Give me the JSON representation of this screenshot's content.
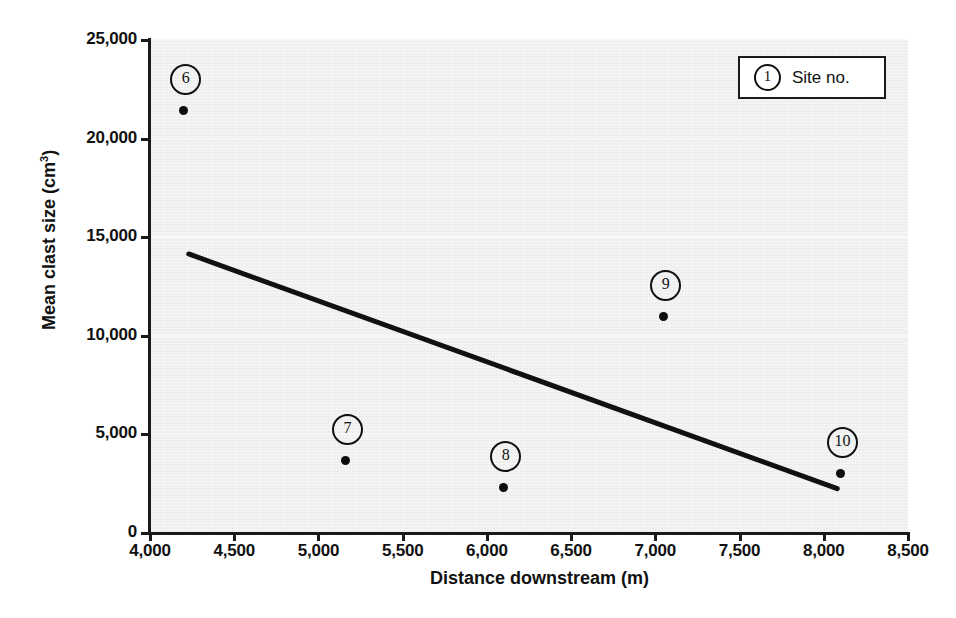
{
  "chart_data": {
    "type": "scatter",
    "title": "",
    "xlabel": "Distance downstream (m)",
    "ylabel": "Mean clast size (cm³)",
    "ylabel_base": "Mean clast size (cm",
    "ylabel_sup": "3",
    "ylabel_close": ")",
    "xlim": [
      4000,
      8500
    ],
    "ylim": [
      0,
      25000
    ],
    "grid": true,
    "grid_orientation": "horizontal",
    "x_ticks": [
      4000,
      4500,
      5000,
      5500,
      6000,
      6500,
      7000,
      7500,
      8000,
      8500
    ],
    "x_tick_labels": [
      "4,000",
      "4,500",
      "5,000",
      "5,500",
      "6,000",
      "6,500",
      "7,000",
      "7,500",
      "8,000",
      "8,500"
    ],
    "y_ticks": [
      0,
      5000,
      10000,
      15000,
      20000,
      25000
    ],
    "y_tick_labels": [
      "0",
      "5,000",
      "10,000",
      "15,000",
      "20,000",
      "25,000"
    ],
    "points": [
      {
        "label": "6",
        "x": 4200,
        "y": 21400
      },
      {
        "label": "7",
        "x": 5160,
        "y": 3700
      },
      {
        "label": "8",
        "x": 6100,
        "y": 2300
      },
      {
        "label": "9",
        "x": 7050,
        "y": 11000
      },
      {
        "label": "10",
        "x": 8100,
        "y": 3000
      }
    ],
    "trend_line": {
      "x1": 4230,
      "y1": 14150,
      "x2": 8080,
      "y2": 2250
    },
    "colors": {
      "plot_background": "#ededed",
      "gridline": "#f7f7f7",
      "axis": "#1a1a1a",
      "marker": "#0d0d0d",
      "trend_line": "#111111",
      "legend_background": "#ffffff",
      "text": "#111111"
    }
  },
  "legend": {
    "marker_symbol": "1",
    "label": "Site no."
  }
}
